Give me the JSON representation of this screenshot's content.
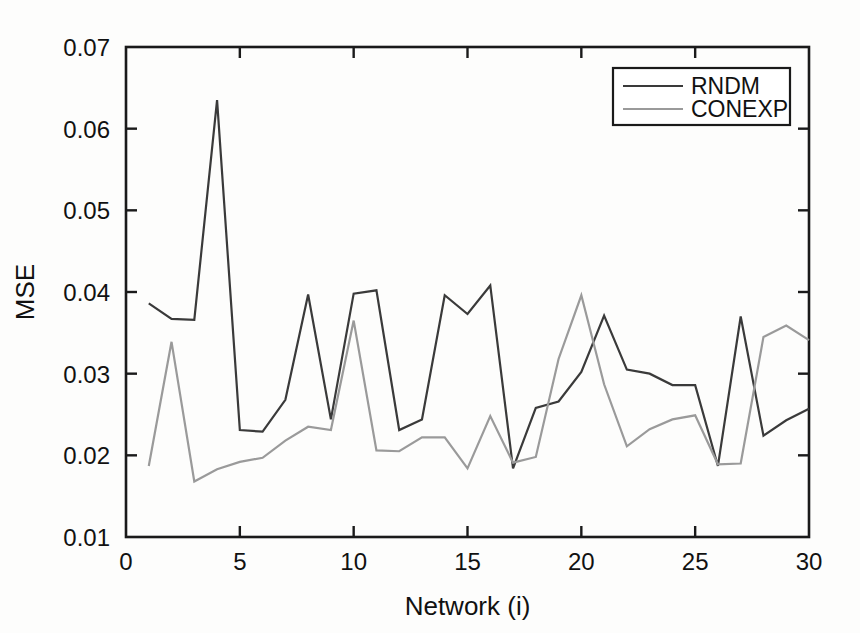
{
  "chart_data": {
    "type": "line",
    "title": "",
    "xlabel": "Network (i)",
    "ylabel": "MSE",
    "xlim": [
      0,
      30
    ],
    "ylim": [
      0.01,
      0.07
    ],
    "xticks": [
      0,
      5,
      10,
      15,
      20,
      25,
      30
    ],
    "xtick_labels": [
      "0",
      "5",
      "10",
      "15",
      "20",
      "25",
      "30"
    ],
    "yticks": [
      0.01,
      0.02,
      0.03,
      0.04,
      0.05,
      0.06,
      0.07
    ],
    "ytick_labels": [
      "0.01",
      "0.02",
      "0.03",
      "0.04",
      "0.05",
      "0.06",
      "0.07"
    ],
    "grid": false,
    "legend_position": "top-right",
    "x": [
      1,
      2,
      3,
      4,
      5,
      6,
      7,
      8,
      9,
      10,
      11,
      12,
      13,
      14,
      15,
      16,
      17,
      18,
      19,
      20,
      21,
      22,
      23,
      24,
      25,
      26,
      27,
      28,
      29,
      30
    ],
    "series": [
      {
        "name": "RNDM",
        "color": "#3a3a3a",
        "values": [
          0.0386,
          0.0367,
          0.0366,
          0.0635,
          0.0231,
          0.0229,
          0.0268,
          0.0397,
          0.0244,
          0.0398,
          0.0402,
          0.0231,
          0.0244,
          0.0396,
          0.0373,
          0.0408,
          0.0184,
          0.0258,
          0.0266,
          0.0302,
          0.0371,
          0.0305,
          0.03,
          0.0286,
          0.0286,
          0.0187,
          0.037,
          0.0224,
          0.0243,
          0.0257
        ]
      },
      {
        "name": "CONEXP",
        "color": "#9a9a9a",
        "values": [
          0.0187,
          0.0339,
          0.0168,
          0.0183,
          0.0192,
          0.0197,
          0.0218,
          0.0235,
          0.0231,
          0.0365,
          0.0206,
          0.0205,
          0.0222,
          0.0222,
          0.0184,
          0.0248,
          0.0191,
          0.0198,
          0.0318,
          0.0396,
          0.0287,
          0.0211,
          0.0232,
          0.0244,
          0.0249,
          0.0189,
          0.019,
          0.0345,
          0.0359,
          0.0341
        ]
      }
    ],
    "legend": [
      {
        "label": "RNDM",
        "color": "#3a3a3a"
      },
      {
        "label": "CONEXP",
        "color": "#9a9a9a"
      }
    ]
  },
  "axes_geometry": {
    "left_px": 126,
    "right_px": 809,
    "top_px": 47,
    "bottom_px": 537
  }
}
